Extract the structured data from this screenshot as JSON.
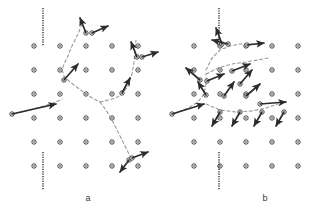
{
  "figure": {
    "type": "scientific-diagram",
    "background_color": "#ffffff",
    "ink_color": "#2b2b2b",
    "dash_color": "#9a9a9a",
    "width": 321,
    "height": 217
  },
  "panels": [
    {
      "id": "panel-a",
      "label": "a",
      "label_x": 88,
      "label_y": 201,
      "origin_x": 8,
      "origin_y": 8,
      "lattice": {
        "marker": "open-circle",
        "radius": 2.2,
        "inner_radius": 0.8,
        "spacing_x": 26,
        "spacing_y": 24,
        "cols": 6,
        "rows": 6,
        "start_x": 34,
        "start_y": 46,
        "point_count": 36
      },
      "guide_lines": [
        {
          "name": "upper-crack-line",
          "x": 43,
          "y1": 8,
          "y2": 46,
          "style": "dotted"
        },
        {
          "name": "lower-crack-line",
          "x": 43,
          "y1": 152,
          "y2": 190,
          "style": "dotted"
        }
      ],
      "boundary_curves": [
        {
          "name": "boundary-upper",
          "points": "82,24 78,34 72,46 68,56 64,64 62,70 64,76 70,82 78,88 86,94 94,99 100,102"
        },
        {
          "name": "boundary-left",
          "points": "14,114 30,110 44,106 56,102 62,99"
        },
        {
          "name": "boundary-right",
          "points": "100,102 108,100 116,98 122,94 128,86 132,74 134,62 135,50 136,40"
        },
        {
          "name": "boundary-lower",
          "points": "100,102 106,110 112,120 118,132 124,144 128,152 131,158"
        }
      ],
      "arrows": [
        {
          "name": "arrow-1",
          "x1": 86,
          "y1": 33,
          "x2": 80,
          "y2": 18
        },
        {
          "name": "arrow-2",
          "x1": 92,
          "y1": 33,
          "x2": 108,
          "y2": 26
        },
        {
          "name": "arrow-3",
          "x1": 137,
          "y1": 57,
          "x2": 131,
          "y2": 42
        },
        {
          "name": "arrow-4",
          "x1": 142,
          "y1": 57,
          "x2": 158,
          "y2": 52
        },
        {
          "name": "arrow-5",
          "x1": 64,
          "y1": 80,
          "x2": 78,
          "y2": 64
        },
        {
          "name": "arrow-6",
          "x1": 12,
          "y1": 114,
          "x2": 56,
          "y2": 104
        },
        {
          "name": "arrow-7",
          "x1": 122,
          "y1": 93,
          "x2": 130,
          "y2": 78
        },
        {
          "name": "arrow-8",
          "x1": 129,
          "y1": 160,
          "x2": 120,
          "y2": 172
        },
        {
          "name": "arrow-9",
          "x1": 132,
          "y1": 158,
          "x2": 148,
          "y2": 152
        }
      ]
    },
    {
      "id": "panel-b",
      "label": "b",
      "label_x": 265,
      "label_y": 201,
      "origin_x": 168,
      "origin_y": 8,
      "lattice": {
        "marker": "open-circle",
        "radius": 2.2,
        "inner_radius": 0.8,
        "spacing_x": 26,
        "spacing_y": 24,
        "cols": 6,
        "rows": 6,
        "start_x": 194,
        "start_y": 46,
        "point_count": 36
      },
      "guide_lines": [
        {
          "name": "upper-crack-line",
          "x": 219,
          "y1": 8,
          "y2": 46,
          "style": "dotted"
        },
        {
          "name": "lower-crack-line",
          "x": 219,
          "y1": 152,
          "y2": 190,
          "style": "dotted"
        }
      ],
      "boundary_curves": [
        {
          "name": "boundary-upper",
          "points": "206,70 212,58 220,50 230,46 240,44 250,44 262,44"
        },
        {
          "name": "boundary-left",
          "points": "174,114 188,108 198,102 204,94 206,84 206,74"
        },
        {
          "name": "boundary-mid",
          "points": "206,74 218,68 232,64 246,62 258,60 268,58"
        },
        {
          "name": "boundary-lower",
          "points": "206,104 220,110 236,112 252,111 266,108 278,104"
        }
      ],
      "arrows": [
        {
          "name": "arrow-1",
          "x1": 222,
          "y1": 44,
          "x2": 216,
          "y2": 28
        },
        {
          "name": "arrow-2",
          "x1": 228,
          "y1": 44,
          "x2": 212,
          "y2": 40
        },
        {
          "name": "arrow-3",
          "x1": 247,
          "y1": 45,
          "x2": 264,
          "y2": 43
        },
        {
          "name": "arrow-4",
          "x1": 200,
          "y1": 80,
          "x2": 186,
          "y2": 68
        },
        {
          "name": "arrow-5",
          "x1": 207,
          "y1": 81,
          "x2": 224,
          "y2": 74
        },
        {
          "name": "arrow-6",
          "x1": 232,
          "y1": 71,
          "x2": 250,
          "y2": 64
        },
        {
          "name": "arrow-7",
          "x1": 240,
          "y1": 84,
          "x2": 252,
          "y2": 70
        },
        {
          "name": "arrow-8",
          "x1": 206,
          "y1": 95,
          "x2": 198,
          "y2": 82
        },
        {
          "name": "arrow-9",
          "x1": 224,
          "y1": 96,
          "x2": 234,
          "y2": 82
        },
        {
          "name": "arrow-10",
          "x1": 246,
          "y1": 96,
          "x2": 260,
          "y2": 84
        },
        {
          "name": "arrow-11",
          "x1": 172,
          "y1": 114,
          "x2": 204,
          "y2": 104
        },
        {
          "name": "arrow-12",
          "x1": 260,
          "y1": 104,
          "x2": 286,
          "y2": 102
        },
        {
          "name": "arrow-13",
          "x1": 220,
          "y1": 112,
          "x2": 212,
          "y2": 126
        },
        {
          "name": "arrow-14",
          "x1": 240,
          "y1": 112,
          "x2": 232,
          "y2": 126
        },
        {
          "name": "arrow-15",
          "x1": 262,
          "y1": 112,
          "x2": 254,
          "y2": 126
        },
        {
          "name": "arrow-16",
          "x1": 284,
          "y1": 112,
          "x2": 276,
          "y2": 126
        }
      ]
    }
  ]
}
